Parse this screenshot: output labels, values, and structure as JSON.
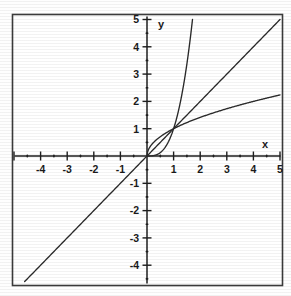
{
  "figure": {
    "title": "",
    "background_color": "#ffffff",
    "border_color": "#3b3b3b",
    "curve_color": "#2a2a2a"
  },
  "axes": {
    "x_axis_label": "x",
    "y_axis_label": "y",
    "x_tick_labels": [
      "-4",
      "-3",
      "-2",
      "-1",
      "1",
      "2",
      "3",
      "4",
      "5"
    ],
    "y_tick_labels": [
      "5",
      "4",
      "3",
      "2",
      "1",
      "-1",
      "-2",
      "-3",
      "-4"
    ],
    "minor_tick_step": 0.5
  },
  "chart_data": {
    "type": "line",
    "title": "",
    "xlabel": "x",
    "ylabel": "y",
    "xlim": [
      -5,
      5
    ],
    "ylim": [
      -5,
      5
    ],
    "grid": false,
    "legend": "none",
    "xticks": [
      -4,
      -3,
      -2,
      -1,
      1,
      2,
      3,
      4,
      5
    ],
    "yticks": [
      5,
      4,
      3,
      2,
      1,
      -1,
      -2,
      -3,
      -4
    ],
    "annotations": [
      "all three curves pass through (0,0) and (1,1)"
    ],
    "series": [
      {
        "name": "y = x^3",
        "expression": "x^3",
        "domain": [
          0,
          1.71
        ],
        "x": [
          0,
          0.1,
          0.2,
          0.3,
          0.4,
          0.5,
          0.6,
          0.7,
          0.8,
          0.9,
          1.0,
          1.1,
          1.2,
          1.3,
          1.4,
          1.5,
          1.6,
          1.71
        ],
        "values": [
          0,
          0.001,
          0.008,
          0.027,
          0.064,
          0.125,
          0.216,
          0.343,
          0.512,
          0.729,
          1.0,
          1.331,
          1.728,
          2.197,
          2.744,
          3.375,
          4.096,
          5.0
        ]
      },
      {
        "name": "y = x",
        "expression": "x",
        "domain": [
          -4.6,
          5
        ],
        "x": [
          -4.6,
          -4,
          -3,
          -2,
          -1,
          0,
          1,
          2,
          3,
          4,
          5
        ],
        "values": [
          -4.6,
          -4,
          -3,
          -2,
          -1,
          0,
          1,
          2,
          3,
          4,
          5
        ]
      },
      {
        "name": "y = x^(1/2)",
        "expression": "sqrt(x)",
        "domain": [
          0,
          5
        ],
        "x": [
          0,
          0.1,
          0.25,
          0.5,
          0.75,
          1.0,
          1.5,
          2.0,
          2.5,
          3.0,
          3.5,
          4.0,
          4.5,
          5.0
        ],
        "values": [
          0,
          0.32,
          0.5,
          0.71,
          0.87,
          1.0,
          1.22,
          1.41,
          1.58,
          1.73,
          1.87,
          2.0,
          2.12,
          2.24
        ]
      }
    ]
  }
}
